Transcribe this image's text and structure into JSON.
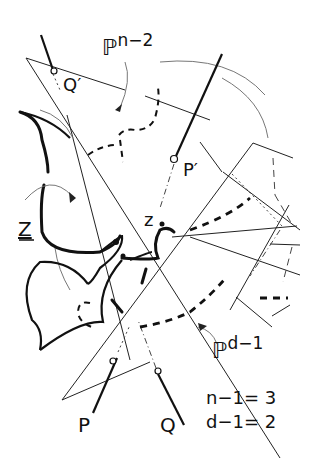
{
  "diagram": {
    "labels": {
      "P_n2_base": "ℙ",
      "P_n2_sup": "n−2",
      "P_d1_base": "ℙ",
      "P_d1_sup": "d−1",
      "Q_prime": "Q′",
      "P_prime": "P′",
      "Z": "Z",
      "z": "z",
      "P": "P",
      "Q": "Q"
    },
    "equations": {
      "line1": "n−1= 3",
      "line2": "d−1= 2"
    }
  }
}
